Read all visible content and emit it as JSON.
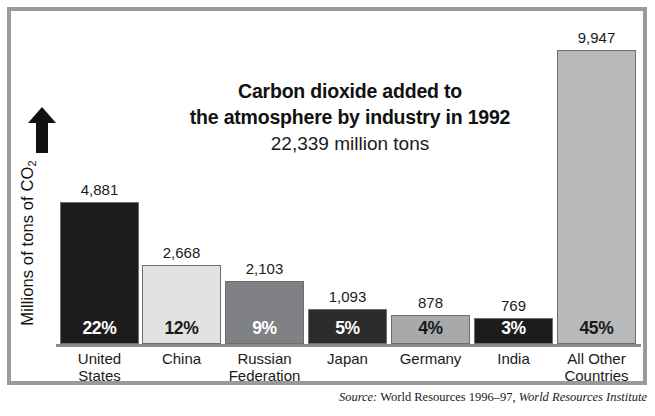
{
  "title": {
    "line1": "Carbon dioxide added to",
    "line2": "the atmosphere by industry in 1992",
    "subtitle": "22,339 million tons"
  },
  "yaxis": {
    "label_prefix": "Millions of tons of CO",
    "label_sub": "2",
    "arrow_icon": "up-arrow-icon"
  },
  "source": {
    "prefix": "Source:",
    "publication": "World Resources 1996–97,",
    "organization": "World Resources Institute"
  },
  "colors": {
    "frame": "#999a9c",
    "baseline": "#8b8c8e",
    "bar_black": "#1c1c1c",
    "bar_light": "#e2e2e2",
    "bar_medium": "#808184",
    "bar_dark": "#2b2b2b",
    "bar_silver": "#a8a9ab",
    "bar_pale": "#b8b9bb"
  },
  "chart_data": {
    "type": "bar",
    "title": "Carbon dioxide added to the atmosphere by industry in 1992",
    "subtitle": "22,339 million tons",
    "xlabel": "",
    "ylabel": "Millions of tons of CO2",
    "ylim": [
      0,
      10400
    ],
    "grid": false,
    "legend": "none",
    "total": 22339,
    "units": "million tons",
    "year": 1992,
    "categories": [
      "United States",
      "China",
      "Russian Federation",
      "Japan",
      "Germany",
      "India",
      "All Other Countries"
    ],
    "values": [
      4881,
      2668,
      2103,
      1093,
      878,
      769,
      9947
    ],
    "value_labels": [
      "4,881",
      "2,668",
      "2,103",
      "1,093",
      "878",
      "769",
      "9,947"
    ],
    "percent_labels": [
      "22%",
      "12%",
      "9%",
      "5%",
      "4%",
      "3%",
      "45%"
    ],
    "percent_values": [
      22,
      12,
      9,
      5,
      4,
      3,
      45
    ]
  },
  "bars": [
    {
      "name": "united-states",
      "label_lines": [
        "United",
        "States"
      ],
      "value": "4,881",
      "percent": "22%",
      "fill": "#1c1c1c",
      "pct_color": "#ffffff",
      "left": 4,
      "width": 79,
      "height": 142
    },
    {
      "name": "china",
      "label_lines": [
        "China"
      ],
      "value": "2,668",
      "percent": "12%",
      "fill": "#e2e2e2",
      "pct_color": "#1a1a1a",
      "left": 86,
      "width": 79,
      "height": 79
    },
    {
      "name": "russian-federation",
      "label_lines": [
        "Russian",
        "Federation"
      ],
      "value": "2,103",
      "percent": "9%",
      "fill": "#808184",
      "pct_color": "#ffffff",
      "left": 169,
      "width": 79,
      "height": 63
    },
    {
      "name": "japan",
      "label_lines": [
        "Japan"
      ],
      "value": "1,093",
      "percent": "5%",
      "fill": "#2b2b2b",
      "pct_color": "#ffffff",
      "left": 252,
      "width": 79,
      "height": 35
    },
    {
      "name": "germany",
      "label_lines": [
        "Germany"
      ],
      "value": "878",
      "percent": "4%",
      "fill": "#a8a9ab",
      "pct_color": "#1a1a1a",
      "left": 335,
      "width": 79,
      "height": 29
    },
    {
      "name": "india",
      "label_lines": [
        "India"
      ],
      "value": "769",
      "percent": "3%",
      "fill": "#1c1c1c",
      "pct_color": "#ffffff",
      "left": 418,
      "width": 79,
      "height": 26
    },
    {
      "name": "all-other-countries",
      "label_lines": [
        "All Other",
        "Countries"
      ],
      "value": "9,947",
      "percent": "45%",
      "fill": "#b8b9bb",
      "pct_color": "#1a1a1a",
      "left": 501,
      "width": 79,
      "height": 294
    }
  ]
}
